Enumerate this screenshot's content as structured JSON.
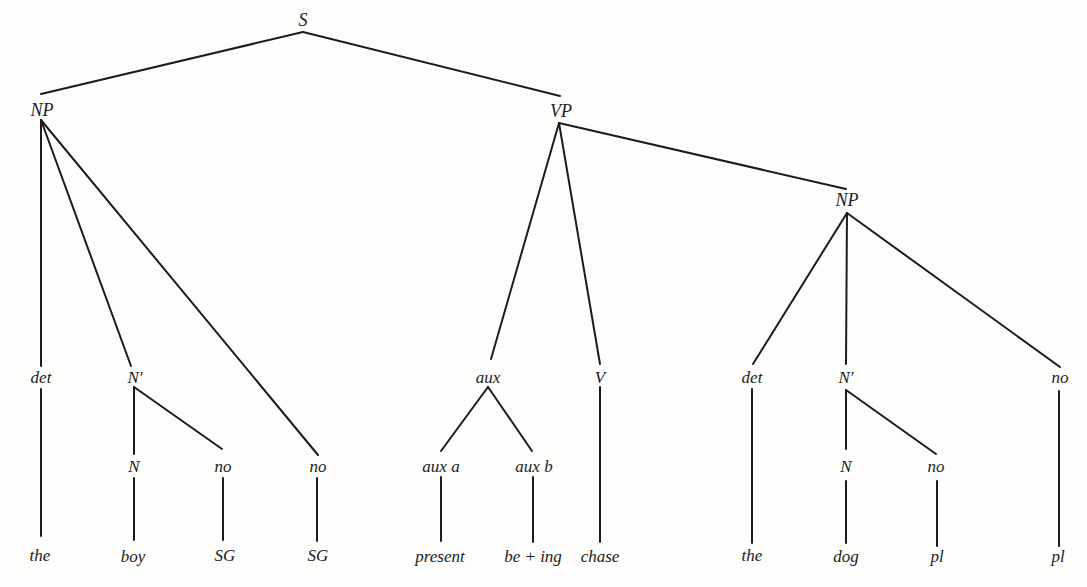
{
  "diagram": {
    "type": "syntax-tree",
    "background": "#fdfdfb",
    "line_color": "#1c1c1c",
    "nodes": [
      {
        "id": "S",
        "label": "S",
        "x": 303,
        "y": 20,
        "kind": "cat"
      },
      {
        "id": "NP1",
        "label": "NP",
        "x": 42,
        "y": 110,
        "kind": "cat"
      },
      {
        "id": "VP",
        "label": "VP",
        "x": 561,
        "y": 111,
        "kind": "cat"
      },
      {
        "id": "NP2",
        "label": "NP",
        "x": 847,
        "y": 200,
        "kind": "cat"
      },
      {
        "id": "det1",
        "label": "det",
        "x": 41,
        "y": 377,
        "kind": "cat"
      },
      {
        "id": "Nbar1",
        "label": "N′",
        "x": 135,
        "y": 377,
        "kind": "cat"
      },
      {
        "id": "no1",
        "label": "no",
        "x": 318,
        "y": 466,
        "kind": "cat"
      },
      {
        "id": "N1",
        "label": "N",
        "x": 134,
        "y": 466,
        "kind": "cat"
      },
      {
        "id": "no2",
        "label": "no",
        "x": 223,
        "y": 466,
        "kind": "cat"
      },
      {
        "id": "aux",
        "label": "aux",
        "x": 488,
        "y": 377,
        "kind": "cat"
      },
      {
        "id": "auxa",
        "label": "aux a",
        "x": 441,
        "y": 466,
        "kind": "cat"
      },
      {
        "id": "auxb",
        "label": "aux b",
        "x": 534,
        "y": 466,
        "kind": "cat"
      },
      {
        "id": "V",
        "label": "V",
        "x": 600,
        "y": 377,
        "kind": "cat"
      },
      {
        "id": "det2",
        "label": "det",
        "x": 752,
        "y": 377,
        "kind": "cat"
      },
      {
        "id": "Nbar2",
        "label": "N′",
        "x": 846,
        "y": 377,
        "kind": "cat"
      },
      {
        "id": "no3",
        "label": "no",
        "x": 1060,
        "y": 377,
        "kind": "cat"
      },
      {
        "id": "N2",
        "label": "N",
        "x": 846,
        "y": 466,
        "kind": "cat"
      },
      {
        "id": "no4",
        "label": "no",
        "x": 936,
        "y": 466,
        "kind": "cat"
      },
      {
        "id": "w_the1",
        "label": "the",
        "x": 40,
        "y": 555,
        "kind": "leaf"
      },
      {
        "id": "w_boy",
        "label": "boy",
        "x": 133,
        "y": 556,
        "kind": "leaf"
      },
      {
        "id": "w_SG1",
        "label": "SG",
        "x": 225,
        "y": 555,
        "kind": "leaf"
      },
      {
        "id": "w_SG2",
        "label": "SG",
        "x": 318,
        "y": 555,
        "kind": "leaf"
      },
      {
        "id": "w_present",
        "label": "present",
        "x": 440,
        "y": 556,
        "kind": "leaf"
      },
      {
        "id": "w_being",
        "label": "be + ing",
        "x": 533,
        "y": 556,
        "kind": "leaf"
      },
      {
        "id": "w_chase",
        "label": "chase",
        "x": 600,
        "y": 556,
        "kind": "leaf"
      },
      {
        "id": "w_the2",
        "label": "the",
        "x": 752,
        "y": 555,
        "kind": "leaf"
      },
      {
        "id": "w_dog",
        "label": "dog",
        "x": 846,
        "y": 556,
        "kind": "leaf"
      },
      {
        "id": "w_pl1",
        "label": "pl",
        "x": 937,
        "y": 556,
        "kind": "leaf"
      },
      {
        "id": "w_pl2",
        "label": "pl",
        "x": 1058,
        "y": 556,
        "kind": "leaf"
      }
    ],
    "edges": [
      {
        "from": "S",
        "to": "NP1",
        "x1": 303,
        "y1": 32,
        "x2": 41,
        "y2": 94
      },
      {
        "from": "S",
        "to": "VP",
        "x1": 303,
        "y1": 32,
        "x2": 560,
        "y2": 96
      },
      {
        "from": "NP1",
        "to": "det1",
        "x1": 41,
        "y1": 120,
        "x2": 41,
        "y2": 366
      },
      {
        "from": "NP1",
        "to": "Nbar1",
        "x1": 41,
        "y1": 120,
        "x2": 131,
        "y2": 366
      },
      {
        "from": "NP1",
        "to": "no1",
        "x1": 41,
        "y1": 120,
        "x2": 318,
        "y2": 455
      },
      {
        "from": "Nbar1",
        "to": "N1",
        "x1": 134,
        "y1": 387,
        "x2": 134,
        "y2": 454
      },
      {
        "from": "Nbar1",
        "to": "no2",
        "x1": 134,
        "y1": 387,
        "x2": 222,
        "y2": 449
      },
      {
        "from": "det1",
        "to": "w_the1",
        "x1": 41,
        "y1": 389,
        "x2": 41,
        "y2": 536
      },
      {
        "from": "N1",
        "to": "w_boy",
        "x1": 134,
        "y1": 478,
        "x2": 134,
        "y2": 540
      },
      {
        "from": "no2",
        "to": "w_SG1",
        "x1": 223,
        "y1": 478,
        "x2": 223,
        "y2": 540
      },
      {
        "from": "no1",
        "to": "w_SG2",
        "x1": 317,
        "y1": 478,
        "x2": 317,
        "y2": 541
      },
      {
        "from": "VP",
        "to": "aux",
        "x1": 559,
        "y1": 123,
        "x2": 491,
        "y2": 359
      },
      {
        "from": "VP",
        "to": "V",
        "x1": 559,
        "y1": 123,
        "x2": 600,
        "y2": 364
      },
      {
        "from": "VP",
        "to": "NP2",
        "x1": 559,
        "y1": 123,
        "x2": 846,
        "y2": 189
      },
      {
        "from": "aux",
        "to": "auxa",
        "x1": 488,
        "y1": 387,
        "x2": 441,
        "y2": 451
      },
      {
        "from": "aux",
        "to": "auxb",
        "x1": 488,
        "y1": 387,
        "x2": 532,
        "y2": 451
      },
      {
        "from": "auxa",
        "to": "w_present",
        "x1": 441,
        "y1": 477,
        "x2": 441,
        "y2": 541
      },
      {
        "from": "auxb",
        "to": "w_being",
        "x1": 533,
        "y1": 477,
        "x2": 533,
        "y2": 542
      },
      {
        "from": "V",
        "to": "w_chase",
        "x1": 600,
        "y1": 387,
        "x2": 600,
        "y2": 542
      },
      {
        "from": "NP2",
        "to": "det2",
        "x1": 847,
        "y1": 213,
        "x2": 753,
        "y2": 364
      },
      {
        "from": "NP2",
        "to": "Nbar2",
        "x1": 847,
        "y1": 213,
        "x2": 846,
        "y2": 364
      },
      {
        "from": "NP2",
        "to": "no3",
        "x1": 847,
        "y1": 213,
        "x2": 1060,
        "y2": 367
      },
      {
        "from": "det2",
        "to": "w_the2",
        "x1": 752,
        "y1": 389,
        "x2": 752,
        "y2": 543
      },
      {
        "from": "Nbar2",
        "to": "N2",
        "x1": 846,
        "y1": 390,
        "x2": 846,
        "y2": 449
      },
      {
        "from": "Nbar2",
        "to": "no4",
        "x1": 846,
        "y1": 390,
        "x2": 936,
        "y2": 454
      },
      {
        "from": "N2",
        "to": "w_dog",
        "x1": 846,
        "y1": 481,
        "x2": 846,
        "y2": 543
      },
      {
        "from": "no4",
        "to": "w_pl1",
        "x1": 937,
        "y1": 481,
        "x2": 937,
        "y2": 546
      },
      {
        "from": "no3",
        "to": "w_pl2",
        "x1": 1059,
        "y1": 391,
        "x2": 1059,
        "y2": 546
      }
    ]
  }
}
